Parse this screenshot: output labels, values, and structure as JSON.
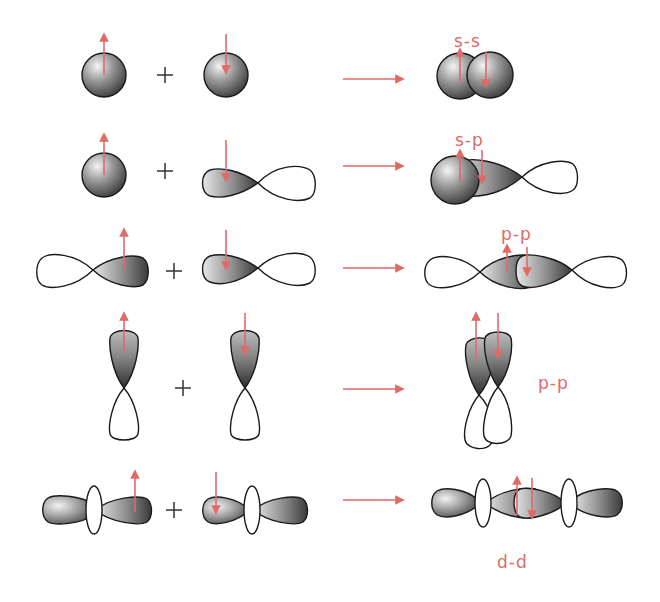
{
  "diagram": {
    "colors": {
      "arrow": "#e06a66",
      "label": "#e06a66",
      "outline": "#1a1a1a",
      "lobe_dark": "#3a3a3a",
      "lobe_light": "#d8d8d8",
      "plus": "#333333"
    },
    "operator_symbol": "+",
    "rows": [
      {
        "id": "s-s",
        "left": "s orbital (spin up)",
        "right": "s orbital (spin down)",
        "result_label": "s-s"
      },
      {
        "id": "s-p",
        "left": "s orbital (spin up)",
        "right": "p orbital (spin down)",
        "result_label": "s-p"
      },
      {
        "id": "p-p-axial",
        "left": "p orbital (spin up)",
        "right": "p orbital (spin down)",
        "result_label": "p-p"
      },
      {
        "id": "p-p-side",
        "left": "p orbital vertical (spin up)",
        "right": "p orbital vertical (spin down)",
        "result_label": "p-p"
      },
      {
        "id": "d-d",
        "left": "d orbital (spin up)",
        "right": "d orbital (spin down)",
        "result_label": "d-d"
      }
    ]
  }
}
